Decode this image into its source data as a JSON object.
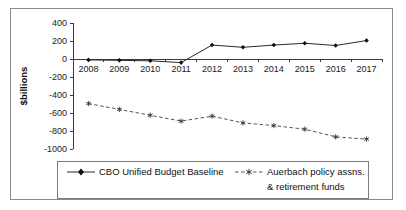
{
  "chart_data": {
    "type": "line",
    "title": "",
    "xlabel": "",
    "ylabel": "$billions",
    "categories": [
      "2008",
      "2009",
      "2010",
      "2011",
      "2012",
      "2013",
      "2014",
      "2015",
      "2016",
      "2017"
    ],
    "yticks": [
      400,
      200,
      0,
      -200,
      -400,
      -600,
      -800,
      -1000
    ],
    "ylim": [
      -1000,
      400
    ],
    "grid": false,
    "legend_position": "bottom",
    "series": [
      {
        "name": "CBO Unified Budget Baseline",
        "marker": "filled-diamond",
        "linestyle": "solid",
        "color": "#2b2b2b",
        "values": [
          -10,
          -15,
          -20,
          -40,
          155,
          130,
          155,
          175,
          150,
          205
        ]
      },
      {
        "name": "Auerbach policy assns. & retirement funds",
        "marker": "star",
        "linestyle": "dashed",
        "color": "#555555",
        "values": [
          -495,
          -560,
          -625,
          -690,
          -635,
          -710,
          -740,
          -780,
          -865,
          -890
        ]
      }
    ]
  },
  "axis": {
    "y_title": "$billions",
    "y_tick_labels": [
      "400",
      "200",
      "0",
      "-200",
      "-400",
      "-600",
      "-800",
      "-1000"
    ],
    "x_tick_labels": [
      "2008",
      "2009",
      "2010",
      "2011",
      "2012",
      "2013",
      "2014",
      "2015",
      "2016",
      "2017"
    ]
  },
  "legend": {
    "entry_one_label": "CBO Unified Budget Baseline",
    "entry_two_label_line1": "Auerbach policy assns.",
    "entry_two_label_line2": "& retirement funds"
  }
}
